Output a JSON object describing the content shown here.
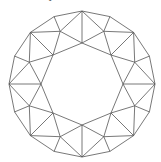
{
  "caption": "top view of crown",
  "diagram": {
    "type": "round-brilliant-crown",
    "center": [
      82,
      84
    ],
    "girdle_radius": 73,
    "kite_radius": 57,
    "table_radius": 41,
    "stroke_color": "#555555",
    "background": "#ffffff"
  }
}
